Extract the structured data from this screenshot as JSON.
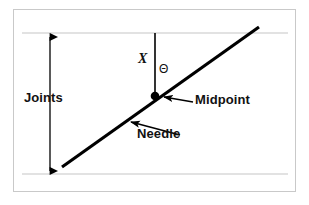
{
  "figure": {
    "kind": "buffon-needle-diagram",
    "background_color": "#ffffff",
    "frame": {
      "border_color": "#c9c9c9",
      "fill_color": "#ffffff",
      "x": 13,
      "y": 9,
      "width": 283,
      "height": 183
    },
    "joint_lines": {
      "name": "parallel floorboard joints",
      "color": "#d8d8d8",
      "top_y": 33,
      "bottom_y": 174,
      "x_start": 22,
      "x_end": 288
    },
    "dimension_arrow": {
      "name": "joints-spacing-arrow",
      "color": "#000000",
      "x": 50,
      "y_top": 35,
      "y_bottom": 173,
      "double_headed": true
    },
    "needle": {
      "color": "#000000",
      "stroke_width": 3,
      "x1": 62,
      "y1": 167,
      "x2": 259,
      "y2": 27
    },
    "perpendicular": {
      "name": "x-distance-line",
      "color": "#000000",
      "stroke_width": 1.6,
      "x": 155,
      "y_top": 33,
      "y_bottom": 96
    },
    "midpoint_dot": {
      "color": "#000000",
      "cx": 155,
      "cy": 96,
      "r": 4.2
    },
    "midpoint_pointer": {
      "from_x": 193,
      "from_y": 102,
      "to_x": 163,
      "to_y": 97
    },
    "needle_pointer": {
      "from_x": 180,
      "from_y": 135,
      "to_x": 130,
      "to_y": 122
    },
    "labels": {
      "joints": "Joints",
      "midpoint": "Midpoint",
      "needle": "Needle",
      "x": "X",
      "theta": "Θ"
    }
  }
}
